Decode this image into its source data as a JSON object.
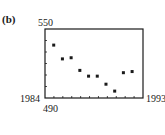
{
  "panel_label": "(b)",
  "axes": {
    "x_min_label": "1984",
    "x_max_label": "1993",
    "y_min_label": "490",
    "y_max_label": "550"
  },
  "chart_data": {
    "type": "scatter",
    "title": "",
    "xlabel": "",
    "ylabel": "",
    "xlim": [
      1984,
      1993
    ],
    "ylim": [
      490,
      550
    ],
    "grid": false,
    "x_tick_count": 11,
    "y_tick_count": 6,
    "x": [
      1984.8,
      1985.6,
      1986.4,
      1987.2,
      1988.0,
      1988.8,
      1989.6,
      1990.4,
      1991.2,
      1992.0
    ],
    "y": [
      536,
      524,
      525,
      514,
      509,
      509,
      502,
      496,
      512,
      513
    ],
    "marker": "square"
  }
}
